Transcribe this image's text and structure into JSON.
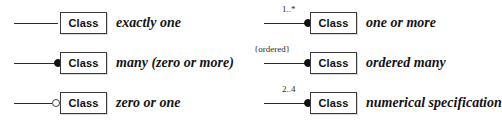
{
  "diagram": {
    "class_box_label": "Class",
    "colors": {
      "line": "#2b2b2b",
      "box_border": "#3a3a3a",
      "box_fill": "#ffffff",
      "filled_dot": "#111111",
      "hollow_dot_border": "#4a4a4a",
      "text": "#141414",
      "background": "#ffffff"
    },
    "entries": [
      {
        "id": "exactly-one",
        "multiplicity_label": "",
        "adornment": "none",
        "class_label": "Class",
        "description": "exactly one",
        "column": "left",
        "row": 1
      },
      {
        "id": "many-zero-or-more",
        "multiplicity_label": "",
        "adornment": "filled-circle",
        "class_label": "Class",
        "description": "many (zero or more)",
        "column": "left",
        "row": 2
      },
      {
        "id": "zero-or-one",
        "multiplicity_label": "",
        "adornment": "hollow-circle",
        "class_label": "Class",
        "description": "zero or one",
        "column": "left",
        "row": 3
      },
      {
        "id": "one-or-more",
        "multiplicity_label": "1..*",
        "adornment": "filled-circle",
        "class_label": "Class",
        "description": "one or more",
        "column": "right",
        "row": 1
      },
      {
        "id": "ordered-many",
        "multiplicity_label": "{ordered}",
        "adornment": "filled-circle",
        "class_label": "Class",
        "description": "ordered many",
        "column": "right",
        "row": 2
      },
      {
        "id": "numerical-specification",
        "multiplicity_label": "2..4",
        "adornment": "filled-circle",
        "class_label": "Class",
        "description": "numerical specification",
        "column": "right",
        "row": 3
      }
    ]
  }
}
